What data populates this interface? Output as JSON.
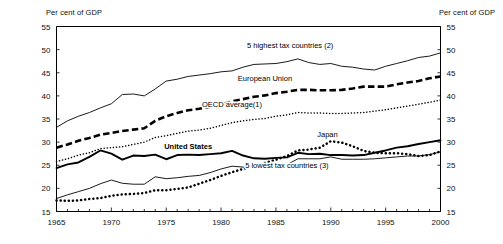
{
  "chart_data": {
    "type": "line",
    "title": "",
    "subtitle": "",
    "xlabel": "",
    "ylabel": "Per cent of GDP",
    "ylabel_right": "Per cent of GDP",
    "xlim": [
      1965,
      2000
    ],
    "ylim": [
      15,
      55
    ],
    "yticks": [
      15,
      20,
      25,
      30,
      35,
      40,
      45,
      50,
      55
    ],
    "xticks": [
      1965,
      1970,
      1975,
      1980,
      1985,
      1990,
      1995,
      2000
    ],
    "minor_xticks_interval": 1,
    "grid": false,
    "legend_position": "inline-annotations",
    "x": [
      1965,
      1966,
      1967,
      1968,
      1969,
      1970,
      1971,
      1972,
      1973,
      1974,
      1975,
      1976,
      1977,
      1978,
      1979,
      1980,
      1981,
      1982,
      1983,
      1984,
      1985,
      1986,
      1987,
      1988,
      1989,
      1990,
      1991,
      1992,
      1993,
      1994,
      1995,
      1996,
      1997,
      1998,
      1999,
      2000
    ],
    "series": [
      {
        "name": "5 highest tax countries (2)",
        "style": "solid-thin",
        "label": "5 highest tax countries (2)",
        "label_x": 1986.3,
        "label_y": 50.3,
        "values": [
          33.2,
          34.6,
          35.6,
          36.4,
          37.4,
          38.3,
          40.3,
          40.4,
          40.0,
          41.5,
          43.2,
          43.6,
          44.2,
          44.5,
          44.8,
          45.2,
          45.4,
          46.2,
          46.8,
          46.9,
          47.0,
          47.4,
          48.0,
          47.2,
          46.8,
          47.0,
          46.4,
          46.2,
          45.8,
          45.6,
          46.4,
          47.0,
          47.6,
          48.3,
          48.6,
          49.3
        ]
      },
      {
        "name": "European Union",
        "style": "dashed-thick",
        "label": "European Union",
        "label_x": 1984.0,
        "label_y": 43.3,
        "values": [
          28.8,
          29.5,
          30.3,
          30.9,
          31.6,
          32.0,
          32.4,
          32.7,
          33.0,
          34.6,
          35.6,
          36.3,
          36.9,
          37.2,
          37.6,
          38.1,
          38.8,
          39.3,
          39.8,
          40.1,
          40.6,
          40.9,
          41.3,
          41.3,
          41.2,
          41.2,
          41.3,
          41.6,
          42.0,
          42.0,
          42.0,
          42.5,
          42.9,
          43.2,
          43.8,
          44.2
        ]
      },
      {
        "name": "OECD average(1)",
        "style": "dotted-thin",
        "label": "OECD average(1)",
        "label_x": 1981.0,
        "label_y": 37.6,
        "values": [
          25.8,
          26.4,
          27.2,
          27.7,
          28.6,
          28.8,
          29.0,
          29.5,
          30.0,
          31.0,
          31.4,
          31.9,
          32.4,
          32.6,
          33.0,
          33.6,
          34.2,
          34.6,
          34.9,
          35.1,
          35.6,
          35.9,
          36.4,
          36.3,
          36.3,
          36.2,
          36.2,
          36.3,
          36.4,
          36.7,
          37.0,
          37.4,
          37.8,
          38.2,
          38.6,
          39.1
        ]
      },
      {
        "name": "Japan",
        "style": "dotted-thick",
        "label": "Japan",
        "label_x": 1989.7,
        "label_y": 31.1,
        "values": [
          17.4,
          17.3,
          17.4,
          17.7,
          17.9,
          18.4,
          18.7,
          18.8,
          19.0,
          19.6,
          19.6,
          19.9,
          20.2,
          21.0,
          21.8,
          22.7,
          23.5,
          24.2,
          24.8,
          25.5,
          26.2,
          27.0,
          28.2,
          28.4,
          28.8,
          30.2,
          29.9,
          29.1,
          28.1,
          27.7,
          27.6,
          27.6,
          27.4,
          27.0,
          27.2,
          28.0
        ]
      },
      {
        "name": "United States",
        "style": "solid-thick",
        "label": "United States",
        "label_x": 1977.0,
        "label_y": 28.6,
        "values": [
          24.4,
          25.2,
          25.6,
          26.8,
          28.2,
          27.5,
          26.2,
          27.1,
          27.0,
          27.3,
          26.3,
          27.2,
          27.3,
          27.2,
          27.4,
          27.6,
          28.1,
          27.1,
          26.5,
          26.4,
          26.6,
          26.7,
          27.7,
          27.4,
          27.5,
          27.2,
          27.2,
          27.1,
          27.2,
          27.7,
          28.2,
          28.8,
          29.1,
          29.6,
          30.0,
          30.4
        ]
      },
      {
        "name": "5 lowest tax countries (3)",
        "style": "solid-thin",
        "label": "5 lowest tax countries (3)",
        "label_x": 1986.0,
        "label_y": 24.3,
        "values": [
          17.8,
          18.6,
          19.3,
          20.0,
          21.0,
          21.8,
          21.1,
          20.9,
          20.9,
          22.5,
          22.1,
          22.3,
          22.6,
          22.8,
          23.4,
          24.2,
          24.8,
          24.6,
          24.6,
          24.9,
          25.3,
          25.1,
          26.4,
          26.4,
          26.4,
          26.8,
          26.3,
          26.3,
          26.3,
          26.4,
          26.6,
          26.8,
          27.0,
          27.0,
          27.3,
          27.9
        ]
      }
    ]
  }
}
